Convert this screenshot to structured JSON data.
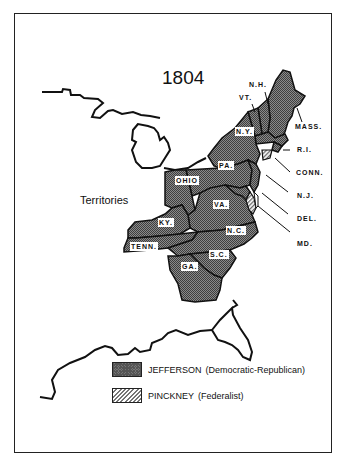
{
  "map": {
    "title": "1804",
    "region_label": "Territories",
    "colors": {
      "jefferson_fill": "#6f6f6f",
      "pinckney_fill": "#bdbdbd",
      "outline": "#111111"
    },
    "state_labels_inside": {
      "ny": "N.Y.",
      "pa": "PA.",
      "ohio": "OHIO",
      "va": "VA.",
      "ky": "KY.",
      "tenn": "TENN.",
      "nc": "N.C.",
      "sc": "S.C.",
      "ga": "GA."
    },
    "state_labels_callout": {
      "nh": "N.H.",
      "vt": "VT.",
      "mass": "MASS.",
      "ri": "R.I.",
      "conn": "CONN.",
      "nj": "N.J.",
      "del": "DEL.",
      "md": "MD."
    }
  },
  "legend": {
    "items": [
      {
        "candidate": "JEFFERSON",
        "party": "(Democratic-Republican)",
        "pattern": "dark-checkered"
      },
      {
        "candidate": "PINCKNEY",
        "party": "(Federalist)",
        "pattern": "hatched"
      }
    ]
  }
}
